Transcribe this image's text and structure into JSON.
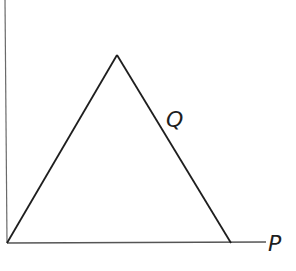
{
  "diagram": {
    "type": "triangle-on-axes",
    "stroke_color": "#1e1e1e",
    "axis_color": "#555555",
    "labels": {
      "x_axis": "P",
      "right_side": "Q"
    },
    "points": {
      "origin": [
        7,
        243
      ],
      "apex": [
        117,
        55
      ],
      "right_base": [
        231,
        243
      ],
      "x_axis_end": [
        266,
        242
      ],
      "y_axis_top": [
        5,
        0
      ]
    }
  }
}
